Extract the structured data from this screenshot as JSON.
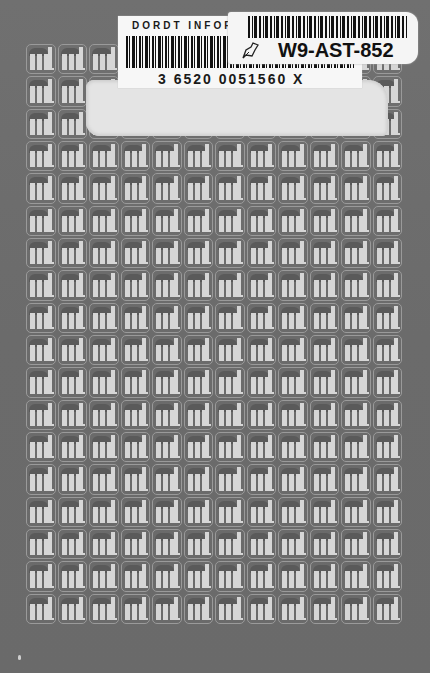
{
  "cover": {
    "background_color": "#6e6e6e",
    "pattern": {
      "logo_text": "ml",
      "columns": 12,
      "rows": 18,
      "tile_color": "#d6d6d6",
      "outline_color": "#9a9a9a"
    }
  },
  "library_label": {
    "institution": "DORDT INFORI",
    "barcode_number": "3 6520 0051560 X"
  },
  "id_sticker": {
    "code": "W9-AST-852",
    "icon": "leaf-icon"
  }
}
